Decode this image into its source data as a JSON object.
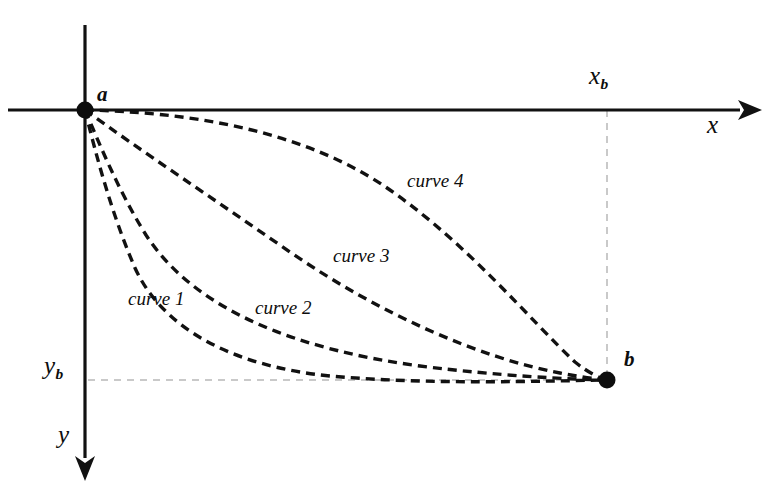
{
  "figure": {
    "background": "#ffffff",
    "ink_color": "#111111",
    "guide_color": "#c9c9c9"
  },
  "axes": {
    "x_label": "x",
    "y_label": "y",
    "x_tick_label": "x",
    "x_tick_subscript": "b",
    "y_tick_label": "y",
    "y_tick_subscript": "b",
    "x_direction": "rightward",
    "y_direction": "downward"
  },
  "points": [
    {
      "id": "a",
      "label": "a",
      "x": 85,
      "y": 110
    },
    {
      "id": "b",
      "label": "b",
      "x": 607,
      "y": 380
    }
  ],
  "curves": [
    {
      "id": "curve1",
      "label": "curve 1",
      "label_x": 128,
      "label_y": 288
    },
    {
      "id": "curve2",
      "label": "curve 2",
      "label_x": 255,
      "label_y": 297
    },
    {
      "id": "curve3",
      "label": "curve 3",
      "label_x": 333,
      "label_y": 245
    },
    {
      "id": "curve4",
      "label": "curve 4",
      "label_x": 407,
      "label_y": 170
    }
  ],
  "chart_data": {
    "type": "line",
    "xlabel": "x",
    "ylabel": "y",
    "xlim": [
      0,
      778
    ],
    "ylim": [
      0,
      492
    ],
    "grid": false,
    "legend": "inline-annotations",
    "note": "y axis increases downward; all four dashed curves join point a at (85,110) to point b at (607,380)",
    "endpoints": {
      "a": [
        85,
        110
      ],
      "b": [
        607,
        380
      ]
    },
    "series": [
      {
        "name": "curve 1",
        "path": "M85,110 C96,155 112,215 135,268 C162,327 230,366 330,376 C430,385 540,381 607,380"
      },
      {
        "name": "curve 2",
        "path": "M85,110 C100,145 118,190 146,235 C196,312 300,350 420,366 C500,376 565,379 607,380"
      },
      {
        "name": "curve 3",
        "path": "M85,110 C140,150 215,200 290,252 C380,314 480,358 560,373 C585,378 598,379 607,380"
      },
      {
        "name": "curve 4",
        "path": "M85,110 C180,112 300,127 390,190 C470,246 530,320 575,362 C590,374 600,378 607,380"
      }
    ]
  }
}
